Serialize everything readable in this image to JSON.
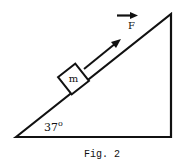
{
  "figure": {
    "caption": "Fig. 2",
    "angle_label": "37",
    "angle_degree_symbol": "o",
    "block_label": "m",
    "force_label": "F"
  },
  "colors": {
    "stroke": "#111111",
    "background": "#ffffff"
  }
}
